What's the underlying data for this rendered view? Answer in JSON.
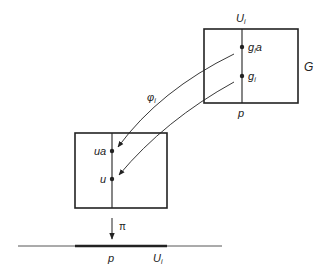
{
  "diagram": {
    "colors": {
      "stroke": "#222222",
      "background": "#ffffff"
    },
    "upper_box": {
      "name": "G",
      "top_label": {
        "main": "U",
        "sub": "i"
      },
      "bottom_label": "p",
      "points": [
        {
          "main": "g",
          "sub": "i",
          "suffix": "a"
        },
        {
          "main": "g",
          "sub": "i",
          "suffix": ""
        }
      ]
    },
    "lower_box": {
      "points": [
        {
          "label": "ua"
        },
        {
          "label": "u"
        }
      ]
    },
    "map_label": {
      "main": "φ",
      "sub": "i"
    },
    "projection_label": "π",
    "base_line": {
      "point_label": "p",
      "set_label": {
        "main": "U",
        "sub": "i"
      }
    }
  }
}
